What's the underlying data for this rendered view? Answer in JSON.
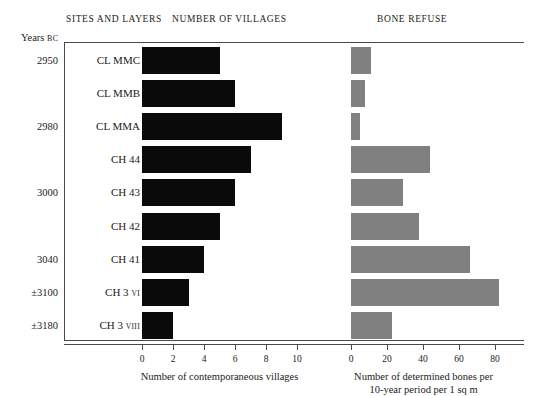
{
  "headers": {
    "sites_and_layers": "Sites and Layers",
    "number_of_villages": "Number of Villages",
    "bone_refuse": "Bone Refuse",
    "years_axis": "Years",
    "years_axis_era": "BC"
  },
  "chart_data": {
    "type": "bar",
    "orientation": "horizontal",
    "categories": [
      "CL MMC",
      "CL MMB",
      "CL MMA",
      "CH 44",
      "CH 43",
      "CH 42",
      "CH 41",
      "CH 3 VI",
      "CH 3 VIII"
    ],
    "category_sublabels": [
      "",
      "",
      "",
      "",
      "",
      "",
      "",
      "VI",
      "VIII"
    ],
    "year_labels": [
      "2950",
      "",
      "2980",
      "",
      "3000",
      "",
      "3040",
      "±3100",
      "±3180"
    ],
    "grid": false,
    "legend": "none",
    "series": [
      {
        "name": "Number of contemporaneous villages",
        "color": "#0a0a0a",
        "panel": "left",
        "values": [
          5,
          6,
          9,
          7,
          6,
          5,
          4,
          3,
          2
        ],
        "xlabel": "Number of contemporaneous villages",
        "xlim": [
          0,
          10
        ],
        "xticks": [
          0,
          2,
          4,
          6,
          8,
          10
        ],
        "xticklabels": [
          "0",
          "2",
          "4",
          "6",
          "8",
          "10"
        ]
      },
      {
        "name": "Number of determined bones per 10-year period per 1 sq m",
        "color": "#808080",
        "panel": "right",
        "values": [
          11,
          8,
          5,
          44,
          29,
          38,
          66,
          82,
          23
        ],
        "xlabel_line1": "Number of determined bones per",
        "xlabel_line2": "10-year period per 1 sq m",
        "xlim": [
          0,
          96
        ],
        "xticks": [
          0,
          20,
          40,
          60,
          80
        ],
        "xticklabels": [
          "0",
          "20",
          "40",
          "60",
          "80"
        ]
      }
    ]
  },
  "colors": {
    "villages_bar": "#0a0a0a",
    "bones_bar": "#808080",
    "axis": "#4a4a4a",
    "text": "#1a1a1a",
    "background": "#ffffff"
  }
}
